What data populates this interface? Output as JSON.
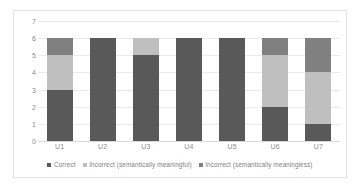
{
  "chart_data": {
    "type": "bar",
    "stacked": true,
    "title": "",
    "xlabel": "",
    "ylabel": "",
    "ylim": [
      0,
      7
    ],
    "ytick_step": 1,
    "yticks": [
      7,
      6,
      5,
      4,
      3,
      2,
      1,
      0
    ],
    "grid": true,
    "legend_position": "bottom",
    "categories": [
      "U1",
      "U2",
      "U3",
      "U4",
      "U5",
      "U6",
      "U7"
    ],
    "series": [
      {
        "name": "Correct",
        "color": "#595959",
        "values": [
          3,
          6,
          5,
          6,
          6,
          2,
          1
        ]
      },
      {
        "name": "Incorrect (semantically meaningful)",
        "color": "#bfbfbf",
        "values": [
          2,
          0,
          1,
          0,
          0,
          3,
          3
        ]
      },
      {
        "name": "Incorrect (semantically meaningless)",
        "color": "#808080",
        "values": [
          1,
          0,
          0,
          0,
          0,
          1,
          2
        ]
      }
    ]
  }
}
